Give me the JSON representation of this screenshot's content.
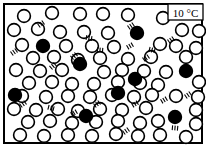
{
  "figure": {
    "width": 206,
    "height": 147,
    "background_color": "#ffffff",
    "border_color": "#000000",
    "border_width": 2
  },
  "temperature_label": {
    "value": "10 °C",
    "box_fill": "#ffffff",
    "box_stroke": "#000000",
    "x": 168,
    "y": 4,
    "width": 35,
    "height": 16
  },
  "legend_semantics": {
    "open_circle": "solvent-particle",
    "filled_circle": "solute-particle",
    "tick_marks": "vibration-motion-lines"
  },
  "chart_data": {
    "type": "scatter",
    "title": "10 °C",
    "xlabel": "",
    "ylabel": "",
    "xlim": [
      5,
      201
    ],
    "ylim": [
      5,
      142
    ],
    "grid": false,
    "legend_position": "none",
    "counts": {
      "open_particles": 75,
      "filled_particles": 9,
      "total_particles": 84
    },
    "particle_radius": 6.4,
    "particle_stroke_width": 1.6,
    "series": [
      {
        "name": "solvent-particle",
        "marker": "open-circle",
        "fill": "#ffffff",
        "stroke": "#000000",
        "points": [
          [
            24,
            16
          ],
          [
            52,
            13
          ],
          [
            80,
            14
          ],
          [
            103,
            14
          ],
          [
            128,
            15
          ],
          [
            163,
            18
          ],
          [
            14,
            30
          ],
          [
            38,
            29
          ],
          [
            60,
            32
          ],
          [
            84,
            32
          ],
          [
            108,
            33
          ],
          [
            182,
            30
          ],
          [
            199,
            31
          ],
          [
            22,
            45
          ],
          [
            66,
            46
          ],
          [
            92,
            46
          ],
          [
            114,
            47
          ],
          [
            160,
            44
          ],
          [
            176,
            46
          ],
          [
            196,
            48
          ],
          [
            33,
            58
          ],
          [
            54,
            57
          ],
          [
            78,
            60
          ],
          [
            100,
            58
          ],
          [
            128,
            59
          ],
          [
            151,
            57
          ],
          [
            186,
            57
          ],
          [
            16,
            70
          ],
          [
            40,
            71
          ],
          [
            62,
            70
          ],
          [
            104,
            72
          ],
          [
            122,
            70
          ],
          [
            144,
            71
          ],
          [
            166,
            72
          ],
          [
            29,
            83
          ],
          [
            52,
            82
          ],
          [
            72,
            84
          ],
          [
            94,
            84
          ],
          [
            118,
            82
          ],
          [
            140,
            83
          ],
          [
            158,
            85
          ],
          [
            199,
            82
          ],
          [
            22,
            96
          ],
          [
            46,
            97
          ],
          [
            68,
            96
          ],
          [
            90,
            97
          ],
          [
            112,
            95
          ],
          [
            134,
            97
          ],
          [
            152,
            95
          ],
          [
            176,
            96
          ],
          [
            198,
            97
          ],
          [
            14,
            109
          ],
          [
            36,
            110
          ],
          [
            58,
            109
          ],
          [
            78,
            111
          ],
          [
            100,
            109
          ],
          [
            122,
            110
          ],
          [
            146,
            108
          ],
          [
            196,
            110
          ],
          [
            28,
            122
          ],
          [
            50,
            121
          ],
          [
            72,
            123
          ],
          [
            96,
            122
          ],
          [
            118,
            121
          ],
          [
            140,
            123
          ],
          [
            158,
            121
          ],
          [
            196,
            124
          ],
          [
            20,
            135
          ],
          [
            44,
            136
          ],
          [
            68,
            135
          ],
          [
            92,
            136
          ],
          [
            116,
            134
          ],
          [
            138,
            136
          ],
          [
            160,
            135
          ],
          [
            186,
            137
          ]
        ]
      },
      {
        "name": "solute-particle",
        "marker": "filled-circle",
        "fill": "#000000",
        "stroke": "#000000",
        "points": [
          [
            43,
            46
          ],
          [
            80,
            64
          ],
          [
            137,
            33
          ],
          [
            135,
            79
          ],
          [
            186,
            71
          ],
          [
            15,
            95
          ],
          [
            86,
            116
          ],
          [
            175,
            117
          ],
          [
            118,
            93
          ]
        ]
      }
    ],
    "annotations": [
      {
        "name": "vibration-lines",
        "x": 41,
        "y": 24,
        "angle": -35
      },
      {
        "name": "vibration-lines",
        "x": 14,
        "y": 52,
        "angle": -35
      },
      {
        "name": "vibration-lines",
        "x": 53,
        "y": 66,
        "angle": -40
      },
      {
        "name": "vibration-lines",
        "x": 74,
        "y": 56,
        "angle": -40
      },
      {
        "name": "vibration-lines",
        "x": 89,
        "y": 38,
        "angle": 10
      },
      {
        "name": "vibration-lines",
        "x": 100,
        "y": 50,
        "angle": 5
      },
      {
        "name": "vibration-lines",
        "x": 130,
        "y": 46,
        "angle": -30
      },
      {
        "name": "vibration-lines",
        "x": 146,
        "y": 58,
        "angle": -35
      },
      {
        "name": "vibration-lines",
        "x": 152,
        "y": 50,
        "angle": 15
      },
      {
        "name": "vibration-lines",
        "x": 131,
        "y": 26,
        "angle": -35
      },
      {
        "name": "vibration-lines",
        "x": 171,
        "y": 40,
        "angle": -35
      },
      {
        "name": "vibration-lines",
        "x": 23,
        "y": 104,
        "angle": -35
      },
      {
        "name": "vibration-lines",
        "x": 51,
        "y": 108,
        "angle": 15
      },
      {
        "name": "vibration-lines",
        "x": 74,
        "y": 113,
        "angle": -30
      },
      {
        "name": "vibration-lines",
        "x": 97,
        "y": 104,
        "angle": -35
      },
      {
        "name": "vibration-lines",
        "x": 135,
        "y": 104,
        "angle": -30
      },
      {
        "name": "vibration-lines",
        "x": 164,
        "y": 100,
        "angle": -30
      },
      {
        "name": "vibration-lines",
        "x": 175,
        "y": 128,
        "angle": 5
      },
      {
        "name": "vibration-lines",
        "x": 126,
        "y": 131,
        "angle": -35
      },
      {
        "name": "vibration-lines",
        "x": 188,
        "y": 95,
        "angle": -35
      }
    ]
  }
}
